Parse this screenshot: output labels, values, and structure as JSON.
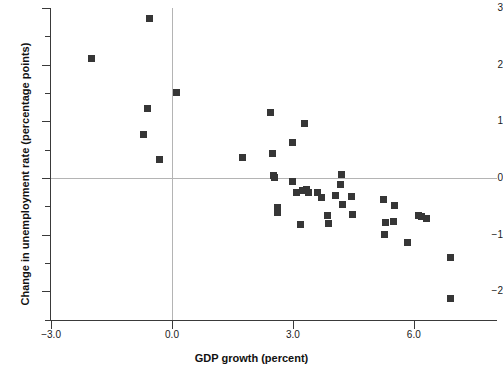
{
  "chart_data": {
    "type": "scatter",
    "title": "",
    "xlabel": "GDP growth (percent)",
    "ylabel": "Change in unemployment rate (percentage points)",
    "xlim": [
      -3.3,
      7.6
    ],
    "ylim": [
      -2.75,
      3.0
    ],
    "xticks": [
      -3.0,
      0.0,
      3.0,
      6.0
    ],
    "xtick_labels": [
      "−3.0",
      "0.0",
      "3.0",
      "6.0"
    ],
    "yticks": [
      3,
      2,
      1,
      0,
      -1,
      -2
    ],
    "ytick_labels": [
      "3",
      "2",
      "1",
      "0",
      "−1",
      "−2"
    ],
    "yticks_minor": [
      2.5,
      1.5,
      0.5,
      -0.5,
      -1.5,
      -2.5
    ],
    "grid": false,
    "reference_lines": {
      "horizontal": 0,
      "vertical": 0
    },
    "legend": null,
    "marker": {
      "shape": "square",
      "color": "#363636",
      "size": 7
    },
    "points": [
      {
        "x": -2.0,
        "y": 2.1
      },
      {
        "x": -0.55,
        "y": 2.82
      },
      {
        "x": 0.1,
        "y": 1.5
      },
      {
        "x": -0.6,
        "y": 1.23
      },
      {
        "x": -0.7,
        "y": 0.77
      },
      {
        "x": -0.3,
        "y": 0.33
      },
      {
        "x": 1.75,
        "y": 0.36
      },
      {
        "x": 2.45,
        "y": 1.15
      },
      {
        "x": 2.5,
        "y": 0.44
      },
      {
        "x": 2.53,
        "y": 0.05
      },
      {
        "x": 2.55,
        "y": 0.01
      },
      {
        "x": 2.62,
        "y": -0.52
      },
      {
        "x": 2.63,
        "y": -0.6
      },
      {
        "x": 2.98,
        "y": 0.62
      },
      {
        "x": 3.3,
        "y": 0.96
      },
      {
        "x": 3.0,
        "y": -0.07
      },
      {
        "x": 3.08,
        "y": -0.25
      },
      {
        "x": 3.25,
        "y": -0.22
      },
      {
        "x": 3.33,
        "y": -0.21
      },
      {
        "x": 3.38,
        "y": -0.25
      },
      {
        "x": 3.2,
        "y": -0.82
      },
      {
        "x": 3.62,
        "y": -0.26
      },
      {
        "x": 3.7,
        "y": -0.34
      },
      {
        "x": 3.85,
        "y": -0.67
      },
      {
        "x": 3.88,
        "y": -0.8
      },
      {
        "x": 4.05,
        "y": -0.31
      },
      {
        "x": 4.2,
        "y": 0.07
      },
      {
        "x": 4.18,
        "y": -0.12
      },
      {
        "x": 4.22,
        "y": -0.47
      },
      {
        "x": 4.45,
        "y": -0.32
      },
      {
        "x": 4.48,
        "y": -0.64
      },
      {
        "x": 5.25,
        "y": -0.38
      },
      {
        "x": 5.3,
        "y": -0.79
      },
      {
        "x": 5.28,
        "y": -1.0
      },
      {
        "x": 5.52,
        "y": -0.49
      },
      {
        "x": 5.5,
        "y": -0.77
      },
      {
        "x": 5.85,
        "y": -1.13
      },
      {
        "x": 6.12,
        "y": -0.66
      },
      {
        "x": 6.18,
        "y": -0.68
      },
      {
        "x": 6.32,
        "y": -0.72
      },
      {
        "x": 6.9,
        "y": -1.4
      },
      {
        "x": 6.92,
        "y": -2.12
      }
    ]
  }
}
